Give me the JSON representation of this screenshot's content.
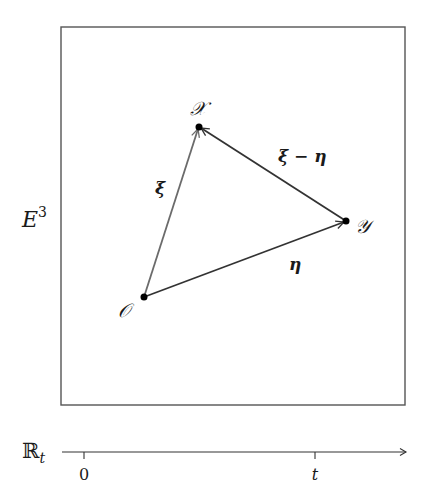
{
  "diagram": {
    "space_label": "E",
    "space_label_superscript": "3",
    "points": [
      {
        "id": "O",
        "label": "𝒪"
      },
      {
        "id": "X",
        "label": "𝒳"
      },
      {
        "id": "Y",
        "label": "𝒴"
      }
    ],
    "vectors": [
      {
        "id": "xi",
        "from": "O",
        "to": "X",
        "label": "ξ",
        "color": "#6b6b6b"
      },
      {
        "id": "eta",
        "from": "O",
        "to": "Y",
        "label": "η",
        "color": "#333333"
      },
      {
        "id": "xi_minus_eta",
        "from": "Y",
        "to": "X",
        "label": "ξ − η",
        "color": "#333333"
      }
    ],
    "time_axis": {
      "label": "ℝ",
      "label_subscript": "t",
      "ticks": [
        {
          "label": "0"
        },
        {
          "label": "t"
        }
      ]
    },
    "colors": {
      "frame": "#555555",
      "point": "#000000",
      "axis": "#333333"
    }
  }
}
